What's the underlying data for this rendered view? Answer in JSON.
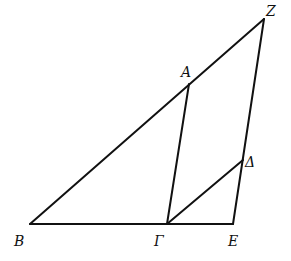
{
  "diagram": {
    "points": {
      "Z": {
        "label": "Z"
      },
      "A": {
        "label": "A"
      },
      "D": {
        "label": "Δ"
      },
      "B": {
        "label": "B"
      },
      "G": {
        "label": "Γ"
      },
      "E": {
        "label": "E"
      }
    },
    "segments": [
      "BZ",
      "BE",
      "AΓ",
      "ZE",
      "ΓΔ"
    ]
  }
}
